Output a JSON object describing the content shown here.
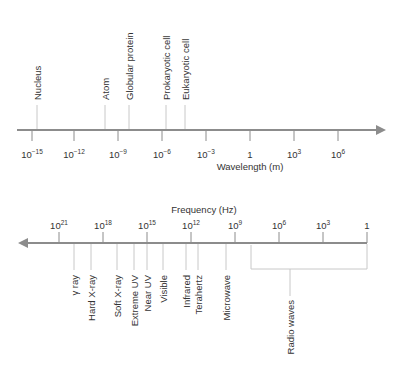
{
  "wavelength_axis": {
    "title": "Wavelength (m)",
    "direction": "right",
    "ticks": [
      {
        "base": "10",
        "exp": "−15",
        "x": 32
      },
      {
        "base": "10",
        "exp": "−12",
        "x": 74
      },
      {
        "base": "10",
        "exp": "−9",
        "x": 118
      },
      {
        "base": "10",
        "exp": "−6",
        "x": 162
      },
      {
        "base": "10",
        "exp": "−3",
        "x": 206
      },
      {
        "base": "1",
        "exp": "",
        "x": 250
      },
      {
        "base": "10",
        "exp": "3",
        "x": 294
      },
      {
        "base": "10",
        "exp": "6",
        "x": 338
      }
    ],
    "markers": [
      {
        "label": "Nucleus",
        "x": 37,
        "top": 100
      },
      {
        "label": "Atom",
        "x": 105,
        "top": 100
      },
      {
        "label": "Globular protein",
        "x": 129,
        "top": 100
      },
      {
        "label": "Prokaryotic cell",
        "x": 166,
        "top": 100
      },
      {
        "label": "Eukaryotic cell",
        "x": 185,
        "top": 100
      }
    ]
  },
  "frequency_axis": {
    "title": "Frequency (Hz)",
    "direction": "left",
    "ticks": [
      {
        "base": "10",
        "exp": "21",
        "x": 59
      },
      {
        "base": "10",
        "exp": "18",
        "x": 103
      },
      {
        "base": "10",
        "exp": "15",
        "x": 147
      },
      {
        "base": "10",
        "exp": "12",
        "x": 191
      },
      {
        "base": "10",
        "exp": "9",
        "x": 235
      },
      {
        "base": "10",
        "exp": "6",
        "x": 279
      },
      {
        "base": "10",
        "exp": "3",
        "x": 323
      },
      {
        "base": "1",
        "exp": "",
        "x": 367
      }
    ],
    "regions": [
      {
        "label": "γ ray",
        "x": 74
      },
      {
        "label": "Hard X-ray",
        "x": 91
      },
      {
        "label": "Soft X-ray",
        "x": 117
      },
      {
        "label": "Extreme UV",
        "x": 134
      },
      {
        "label": "Near UV",
        "x": 147
      },
      {
        "label": "Visible",
        "x": 163
      },
      {
        "label": "Infrared",
        "x": 186
      },
      {
        "label": "Terahertz",
        "x": 198
      },
      {
        "label": "Microwave",
        "x": 226
      }
    ],
    "radio": {
      "label": "Radio waves",
      "x_start": 251,
      "x_end": 367,
      "stem_x": 290
    }
  },
  "colors": {
    "axis": "#8c8c8c",
    "marker_line": "#c8c8c8",
    "text": "#333333"
  }
}
